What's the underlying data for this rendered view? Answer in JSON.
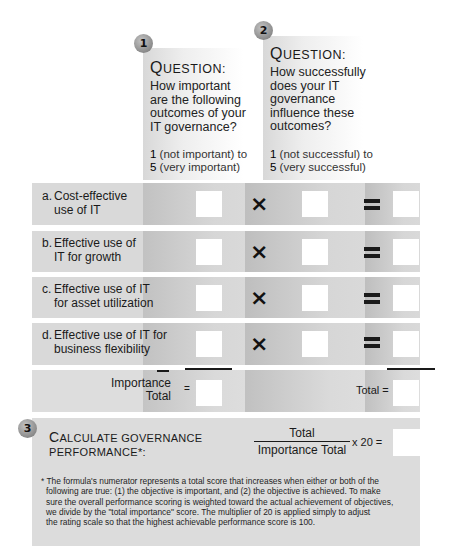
{
  "questions": [
    {
      "number": "1",
      "title_first": "Q",
      "title_rest": "UESTION:",
      "text_lines": [
        "How important",
        "are the following",
        "outcomes of your",
        "IT governance?"
      ],
      "scale_low_num": "1",
      "scale_low_text": " (not important) to",
      "scale_high_num": "5",
      "scale_high_text": " (very important)"
    },
    {
      "number": "2",
      "title_first": "Q",
      "title_rest": "UESTION:",
      "text_lines": [
        "How successfully",
        "does your IT",
        "governance",
        "influence these",
        "outcomes?"
      ],
      "scale_low_num": "1",
      "scale_low_text": " (not successful) to",
      "scale_high_num": "5",
      "scale_high_text": " (very successful)"
    }
  ],
  "outcomes": [
    {
      "letter": "a.",
      "line1": "Cost-effective",
      "line2": "use of IT",
      "importance": "",
      "success": "",
      "product": ""
    },
    {
      "letter": "b.",
      "line1": "Effective use of",
      "line2": "IT for growth",
      "importance": "",
      "success": "",
      "product": ""
    },
    {
      "letter": "c.",
      "line1": "Effective use of IT",
      "line2": "for asset utilization",
      "importance": "",
      "success": "",
      "product": ""
    },
    {
      "letter": "d.",
      "line1": "Effective use of IT for",
      "line2": "business flexibility",
      "importance": "",
      "success": "",
      "product": ""
    }
  ],
  "operators": {
    "times": "×",
    "equals": "="
  },
  "totals": {
    "importance_label_line1": "Importance",
    "importance_label_line2": "Total",
    "importance_eq": "=",
    "importance_value": "",
    "total_label": "Total =",
    "total_value": ""
  },
  "calculate": {
    "number": "3",
    "title_line1_first": "C",
    "title_line1_rest": "ALCULATE GOVERNANCE",
    "title_line2": "PERFORMANCE",
    "title_line2_suffix": "*:",
    "numerator": "Total",
    "denominator": "Importance Total",
    "multiplier": "x 20 =",
    "result": ""
  },
  "footnote": {
    "lines": [
      "* The formula's numerator represents a total score that increases when either or both of the",
      "following are true: (1) the objective is important, and (2) the objective is achieved. To make",
      "sure the overall performance scoring is weighted toward the actual achievement of objectives,",
      "we divide by the \"total importance\" score. The multiplier of 20 is applied simply to adjust",
      "the rating scale so that the highest achievable performance score is 100."
    ]
  }
}
